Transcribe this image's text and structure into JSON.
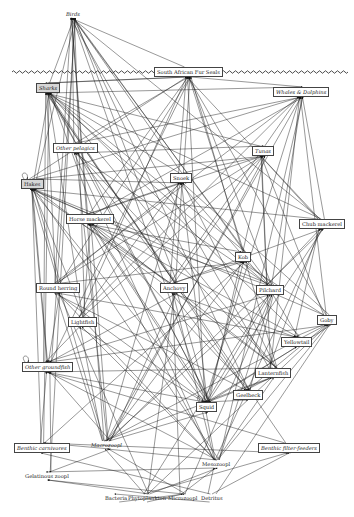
{
  "diagram": {
    "type": "food-web",
    "surface_line": {
      "y": 72,
      "x1": 12,
      "x2": 344
    },
    "nodes": [
      {
        "id": "birds",
        "label": "Birds",
        "x": 64,
        "y": 10,
        "boxed": false,
        "italic": true
      },
      {
        "id": "seals",
        "label": "South African Fur Seals",
        "x": 154,
        "y": 67,
        "boxed": true,
        "italic": false
      },
      {
        "id": "sharks",
        "label": "Sharks",
        "x": 36,
        "y": 83,
        "boxed": true,
        "italic": true,
        "shaded": true
      },
      {
        "id": "whales",
        "label": "Whales & Dolphins",
        "x": 273,
        "y": 87,
        "boxed": true,
        "italic": true
      },
      {
        "id": "otherpel",
        "label": "Other pelagics",
        "x": 53,
        "y": 143,
        "boxed": true,
        "italic": true
      },
      {
        "id": "tunas",
        "label": "Tunas",
        "x": 252,
        "y": 146,
        "boxed": true,
        "italic": true
      },
      {
        "id": "hakes",
        "label": "Hakes",
        "x": 21,
        "y": 179,
        "boxed": true,
        "italic": false,
        "shaded": true
      },
      {
        "id": "snoek",
        "label": "Snoek",
        "x": 170,
        "y": 173,
        "boxed": true,
        "italic": false
      },
      {
        "id": "horsemack",
        "label": "Horse mackerel",
        "x": 66,
        "y": 214,
        "boxed": true,
        "italic": false
      },
      {
        "id": "chubmack",
        "label": "Chub mackerel",
        "x": 299,
        "y": 219,
        "boxed": true,
        "italic": false
      },
      {
        "id": "kob",
        "label": "Kob",
        "x": 235,
        "y": 252,
        "boxed": true,
        "italic": false
      },
      {
        "id": "roundherring",
        "label": "Round herring",
        "x": 36,
        "y": 283,
        "boxed": true,
        "italic": false
      },
      {
        "id": "anchovy",
        "label": "Anchovy",
        "x": 160,
        "y": 283,
        "boxed": true,
        "italic": false
      },
      {
        "id": "pilchard",
        "label": "Pilchard",
        "x": 256,
        "y": 285,
        "boxed": true,
        "italic": false
      },
      {
        "id": "lightfish",
        "label": "Lightfish",
        "x": 68,
        "y": 317,
        "boxed": true,
        "italic": false
      },
      {
        "id": "goby",
        "label": "Goby",
        "x": 317,
        "y": 315,
        "boxed": true,
        "italic": false
      },
      {
        "id": "yellowtail",
        "label": "Yellowtail",
        "x": 281,
        "y": 337,
        "boxed": true,
        "italic": false
      },
      {
        "id": "othergf",
        "label": "Other groundfish",
        "x": 22,
        "y": 362,
        "boxed": true,
        "italic": true
      },
      {
        "id": "lanternfish",
        "label": "Lanternfish",
        "x": 255,
        "y": 368,
        "boxed": true,
        "italic": false
      },
      {
        "id": "squid",
        "label": "Squid",
        "x": 196,
        "y": 402,
        "boxed": true,
        "italic": false
      },
      {
        "id": "geelbeck",
        "label": "Geelbeck",
        "x": 233,
        "y": 390,
        "boxed": true,
        "italic": false
      },
      {
        "id": "benthcarn",
        "label": "Benthic carnivores",
        "x": 14,
        "y": 443,
        "boxed": true,
        "italic": true
      },
      {
        "id": "macrozoopl",
        "label": "Macrozoopl",
        "x": 89,
        "y": 441,
        "boxed": false,
        "italic": true
      },
      {
        "id": "benthfilter",
        "label": "Benthic filter-feeders",
        "x": 258,
        "y": 443,
        "boxed": true,
        "italic": true
      },
      {
        "id": "mesozoopl",
        "label": "Mesozoopl",
        "x": 200,
        "y": 460,
        "boxed": false,
        "italic": false
      },
      {
        "id": "gelzoopl",
        "label": "Gelatinous zoopl",
        "x": 23,
        "y": 472,
        "boxed": false,
        "italic": false
      },
      {
        "id": "bacteria",
        "label": "Bacteria",
        "x": 103,
        "y": 494,
        "boxed": false,
        "italic": false
      },
      {
        "id": "phyto",
        "label": "Phytoplankton",
        "x": 126,
        "y": 494,
        "boxed": false,
        "italic": false
      },
      {
        "id": "microzoopl",
        "label": "Microzoopl",
        "x": 166,
        "y": 494,
        "boxed": false,
        "italic": false
      },
      {
        "id": "detritus",
        "label": "Detritus",
        "x": 199,
        "y": 494,
        "boxed": false,
        "italic": false
      }
    ],
    "edges": [
      [
        "seals",
        "birds"
      ],
      [
        "sharks",
        "birds"
      ],
      [
        "otherpel",
        "birds"
      ],
      [
        "hakes",
        "birds"
      ],
      [
        "snoek",
        "birds"
      ],
      [
        "horsemack",
        "birds"
      ],
      [
        "anchovy",
        "birds"
      ],
      [
        "pilchard",
        "birds"
      ],
      [
        "roundherring",
        "birds"
      ],
      [
        "lightfish",
        "birds"
      ],
      [
        "squid",
        "birds"
      ],
      [
        "lanternfish",
        "birds"
      ],
      [
        "kob",
        "birds"
      ],
      [
        "chubmack",
        "birds"
      ],
      [
        "othergf",
        "birds"
      ],
      [
        "geelbeck",
        "birds"
      ],
      [
        "macrozoopl",
        "birds"
      ],
      [
        "gelzoopl",
        "birds"
      ],
      [
        "sharks",
        "seals"
      ],
      [
        "hakes",
        "seals"
      ],
      [
        "snoek",
        "seals"
      ],
      [
        "horsemack",
        "seals"
      ],
      [
        "anchovy",
        "seals"
      ],
      [
        "pilchard",
        "seals"
      ],
      [
        "squid",
        "seals"
      ],
      [
        "lanternfish",
        "seals"
      ],
      [
        "kob",
        "seals"
      ],
      [
        "chubmack",
        "seals"
      ],
      [
        "othergf",
        "seals"
      ],
      [
        "otherpel",
        "seals"
      ],
      [
        "lightfish",
        "seals"
      ],
      [
        "roundherring",
        "seals"
      ],
      [
        "goby",
        "seals"
      ],
      [
        "seals",
        "sharks"
      ],
      [
        "hakes",
        "sharks"
      ],
      [
        "snoek",
        "sharks"
      ],
      [
        "horsemack",
        "sharks"
      ],
      [
        "anchovy",
        "sharks"
      ],
      [
        "pilchard",
        "sharks"
      ],
      [
        "squid",
        "sharks"
      ],
      [
        "otherpel",
        "sharks"
      ],
      [
        "tunas",
        "sharks"
      ],
      [
        "kob",
        "sharks"
      ],
      [
        "chubmack",
        "sharks"
      ],
      [
        "othergf",
        "sharks"
      ],
      [
        "benthcarn",
        "sharks"
      ],
      [
        "geelbeck",
        "sharks"
      ],
      [
        "yellowtail",
        "sharks"
      ],
      [
        "whales",
        "sharks"
      ],
      [
        "roundherring",
        "sharks"
      ],
      [
        "lanternfish",
        "sharks"
      ],
      [
        "lightfish",
        "sharks"
      ],
      [
        "benthfilter",
        "sharks"
      ],
      [
        "seals",
        "whales"
      ],
      [
        "hakes",
        "whales"
      ],
      [
        "anchovy",
        "whales"
      ],
      [
        "pilchard",
        "whales"
      ],
      [
        "squid",
        "whales"
      ],
      [
        "horsemack",
        "whales"
      ],
      [
        "otherpel",
        "whales"
      ],
      [
        "lanternfish",
        "whales"
      ],
      [
        "mesozoopl",
        "whales"
      ],
      [
        "macrozoopl",
        "whales"
      ],
      [
        "roundherring",
        "whales"
      ],
      [
        "chubmack",
        "whales"
      ],
      [
        "goby",
        "whales"
      ],
      [
        "lightfish",
        "whales"
      ],
      [
        "anchovy",
        "otherpel"
      ],
      [
        "pilchard",
        "otherpel"
      ],
      [
        "squid",
        "otherpel"
      ],
      [
        "macrozoopl",
        "otherpel"
      ],
      [
        "mesozoopl",
        "otherpel"
      ],
      [
        "lanternfish",
        "otherpel"
      ],
      [
        "anchovy",
        "tunas"
      ],
      [
        "pilchard",
        "tunas"
      ],
      [
        "squid",
        "tunas"
      ],
      [
        "horsemack",
        "tunas"
      ],
      [
        "chubmack",
        "tunas"
      ],
      [
        "snoek",
        "tunas"
      ],
      [
        "roundherring",
        "tunas"
      ],
      [
        "hakes",
        "tunas"
      ],
      [
        "otherpel",
        "tunas"
      ],
      [
        "lanternfish",
        "tunas"
      ],
      [
        "macrozoopl",
        "tunas"
      ],
      [
        "lightfish",
        "tunas"
      ],
      [
        "goby",
        "tunas"
      ],
      [
        "hakes",
        "hakes"
      ],
      [
        "horsemack",
        "hakes"
      ],
      [
        "anchovy",
        "hakes"
      ],
      [
        "pilchard",
        "hakes"
      ],
      [
        "squid",
        "hakes"
      ],
      [
        "lanternfish",
        "hakes"
      ],
      [
        "lightfish",
        "hakes"
      ],
      [
        "macrozoopl",
        "hakes"
      ],
      [
        "mesozoopl",
        "hakes"
      ],
      [
        "othergf",
        "hakes"
      ],
      [
        "goby",
        "hakes"
      ],
      [
        "roundherring",
        "hakes"
      ],
      [
        "benthcarn",
        "hakes"
      ],
      [
        "chubmack",
        "hakes"
      ],
      [
        "anchovy",
        "snoek"
      ],
      [
        "pilchard",
        "snoek"
      ],
      [
        "hakes",
        "snoek"
      ],
      [
        "squid",
        "snoek"
      ],
      [
        "horsemack",
        "snoek"
      ],
      [
        "lanternfish",
        "snoek"
      ],
      [
        "roundherring",
        "snoek"
      ],
      [
        "lightfish",
        "snoek"
      ],
      [
        "goby",
        "snoek"
      ],
      [
        "macrozoopl",
        "snoek"
      ],
      [
        "anchovy",
        "horsemack"
      ],
      [
        "macrozoopl",
        "horsemack"
      ],
      [
        "mesozoopl",
        "horsemack"
      ],
      [
        "lanternfish",
        "horsemack"
      ],
      [
        "lightfish",
        "horsemack"
      ],
      [
        "pilchard",
        "horsemack"
      ],
      [
        "squid",
        "horsemack"
      ],
      [
        "anchovy",
        "chubmack"
      ],
      [
        "pilchard",
        "chubmack"
      ],
      [
        "macrozoopl",
        "chubmack"
      ],
      [
        "mesozoopl",
        "chubmack"
      ],
      [
        "lanternfish",
        "chubmack"
      ],
      [
        "squid",
        "chubmack"
      ],
      [
        "anchovy",
        "kob"
      ],
      [
        "pilchard",
        "kob"
      ],
      [
        "squid",
        "kob"
      ],
      [
        "horsemack",
        "kob"
      ],
      [
        "roundherring",
        "kob"
      ],
      [
        "macrozoopl",
        "kob"
      ],
      [
        "goby",
        "kob"
      ],
      [
        "benthcarn",
        "kob"
      ],
      [
        "mesozoopl",
        "roundherring"
      ],
      [
        "macrozoopl",
        "roundherring"
      ],
      [
        "phyto",
        "roundherring"
      ],
      [
        "mesozoopl",
        "anchovy"
      ],
      [
        "macrozoopl",
        "anchovy"
      ],
      [
        "phyto",
        "anchovy"
      ],
      [
        "microzoopl",
        "anchovy"
      ],
      [
        "mesozoopl",
        "pilchard"
      ],
      [
        "macrozoopl",
        "pilchard"
      ],
      [
        "phyto",
        "pilchard"
      ],
      [
        "microzoopl",
        "pilchard"
      ],
      [
        "mesozoopl",
        "lightfish"
      ],
      [
        "macrozoopl",
        "lightfish"
      ],
      [
        "mesozoopl",
        "goby"
      ],
      [
        "macrozoopl",
        "goby"
      ],
      [
        "detritus",
        "goby"
      ],
      [
        "phyto",
        "goby"
      ],
      [
        "anchovy",
        "yellowtail"
      ],
      [
        "pilchard",
        "yellowtail"
      ],
      [
        "squid",
        "yellowtail"
      ],
      [
        "chubmack",
        "yellowtail"
      ],
      [
        "horsemack",
        "yellowtail"
      ],
      [
        "roundherring",
        "yellowtail"
      ],
      [
        "goby",
        "yellowtail"
      ],
      [
        "othergf",
        "othergf"
      ],
      [
        "benthcarn",
        "othergf"
      ],
      [
        "macrozoopl",
        "othergf"
      ],
      [
        "mesozoopl",
        "othergf"
      ],
      [
        "squid",
        "othergf"
      ],
      [
        "anchovy",
        "othergf"
      ],
      [
        "lanternfish",
        "othergf"
      ],
      [
        "lightfish",
        "othergf"
      ],
      [
        "goby",
        "othergf"
      ],
      [
        "hakes",
        "othergf"
      ],
      [
        "benthfilter",
        "othergf"
      ],
      [
        "roundherring",
        "othergf"
      ],
      [
        "pilchard",
        "othergf"
      ],
      [
        "gelzoopl",
        "othergf"
      ],
      [
        "mesozoopl",
        "lanternfish"
      ],
      [
        "macrozoopl",
        "lanternfish"
      ],
      [
        "anchovy",
        "squid"
      ],
      [
        "pilchard",
        "squid"
      ],
      [
        "lanternfish",
        "squid"
      ],
      [
        "macrozoopl",
        "squid"
      ],
      [
        "mesozoopl",
        "squid"
      ],
      [
        "lightfish",
        "squid"
      ],
      [
        "squid",
        "squid"
      ],
      [
        "roundherring",
        "squid"
      ],
      [
        "goby",
        "squid"
      ],
      [
        "horsemack",
        "squid"
      ],
      [
        "anchovy",
        "geelbeck"
      ],
      [
        "pilchard",
        "geelbeck"
      ],
      [
        "squid",
        "geelbeck"
      ],
      [
        "lanternfish",
        "geelbeck"
      ],
      [
        "horsemack",
        "geelbeck"
      ],
      [
        "goby",
        "geelbeck"
      ],
      [
        "roundherring",
        "geelbeck"
      ],
      [
        "benthfilter",
        "benthcarn"
      ],
      [
        "detritus",
        "benthcarn"
      ],
      [
        "macrozoopl",
        "benthcarn"
      ],
      [
        "mesozoopl",
        "macrozoopl"
      ],
      [
        "phyto",
        "macrozoopl"
      ],
      [
        "microzoopl",
        "macrozoopl"
      ],
      [
        "detritus",
        "benthfilter"
      ],
      [
        "phyto",
        "benthfilter"
      ],
      [
        "phyto",
        "mesozoopl"
      ],
      [
        "microzoopl",
        "mesozoopl"
      ],
      [
        "detritus",
        "mesozoopl"
      ],
      [
        "phyto",
        "gelzoopl"
      ],
      [
        "mesozoopl",
        "gelzoopl"
      ],
      [
        "macrozoopl",
        "gelzoopl"
      ],
      [
        "microzoopl",
        "gelzoopl"
      ],
      [
        "detritus",
        "bacteria"
      ],
      [
        "bacteria",
        "microzoopl"
      ],
      [
        "phyto",
        "microzoopl"
      ]
    ]
  }
}
